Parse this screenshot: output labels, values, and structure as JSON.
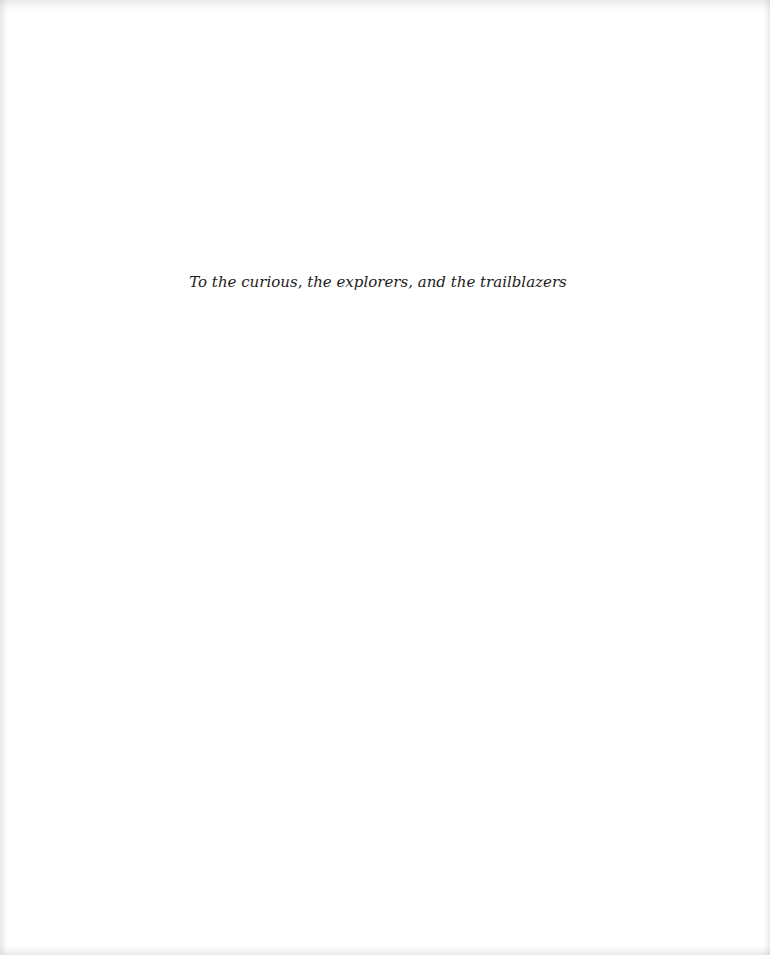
{
  "page": {
    "background_color": "#ffffff",
    "text_color": "#1c1c1c"
  },
  "dedication": {
    "text": "To the curious, the explorers, and the trailblazers"
  }
}
